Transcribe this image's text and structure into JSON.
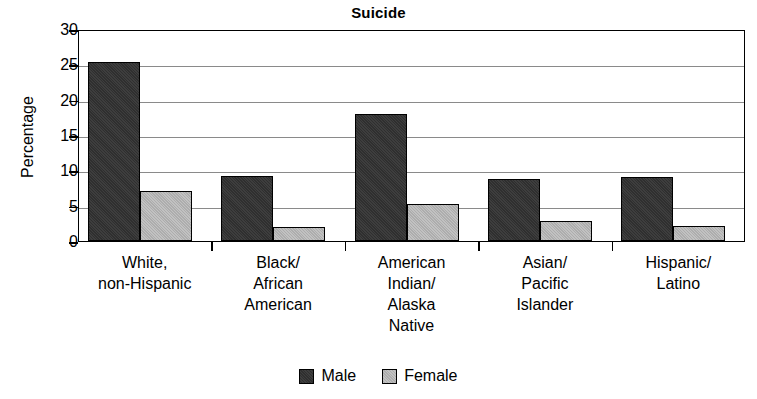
{
  "chart_data": {
    "type": "bar",
    "title": "Suicide",
    "xlabel": "",
    "ylabel": "Percentage",
    "ylim": [
      0,
      30
    ],
    "ytick_step": 5,
    "yticks": [
      0,
      5,
      10,
      15,
      20,
      25,
      30
    ],
    "ytick_labels": [
      "0",
      "5",
      "10",
      "15",
      "20",
      "25",
      "30"
    ],
    "grid": true,
    "legend_position": "bottom-center",
    "categories": [
      "White,\nnon-Hispanic",
      "Black/\nAfrican\nAmerican",
      "American\nIndian/\nAlaska\nNative",
      "Asian/\nPacific\nIslander",
      "Hispanic/\nLatino"
    ],
    "series": [
      {
        "name": "Male",
        "color": "#2f2f2f",
        "values": [
          25.3,
          9.2,
          18.0,
          8.8,
          9.0
        ]
      },
      {
        "name": "Female",
        "color": "#adadad",
        "values": [
          7.1,
          2.0,
          5.2,
          2.9,
          2.1
        ]
      }
    ]
  },
  "legend": {
    "items": [
      {
        "label": "Male",
        "swatch": "male"
      },
      {
        "label": "Female",
        "swatch": "female"
      }
    ]
  }
}
